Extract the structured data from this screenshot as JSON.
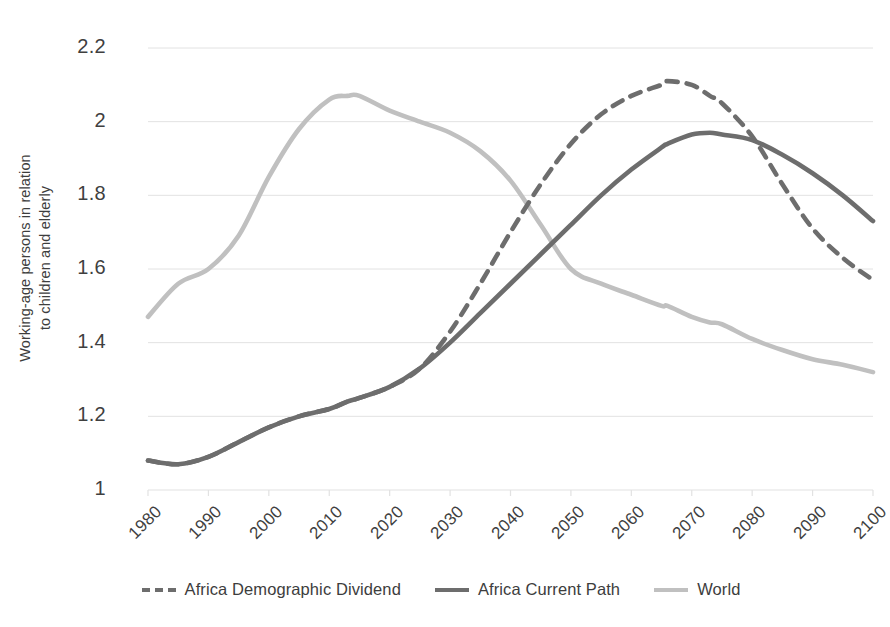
{
  "chart_data": {
    "type": "line",
    "title": "",
    "xlabel": "",
    "ylabel": "Working-age persons in relation to children and elderly",
    "ylabel_line1": "Working-age persons in relation",
    "ylabel_line2": "to children and elderly",
    "xlim": [
      1980,
      2100
    ],
    "ylim": [
      1,
      2.2
    ],
    "grid": true,
    "legend_position": "bottom",
    "yticks": [
      "1",
      "1.2",
      "1.4",
      "1.6",
      "1.8",
      "2",
      "2.2"
    ],
    "ytick_values": [
      1,
      1.2,
      1.4,
      1.6,
      1.8,
      2,
      2.2
    ],
    "xticks": [
      "1980",
      "1990",
      "2000",
      "2010",
      "2020",
      "2030",
      "2040",
      "2050",
      "2060",
      "2070",
      "2080",
      "2090",
      "2100"
    ],
    "xtick_values": [
      1980,
      1990,
      2000,
      2010,
      2020,
      2030,
      2040,
      2050,
      2060,
      2070,
      2080,
      2090,
      2100
    ],
    "x": [
      1980,
      1985,
      1990,
      1995,
      2000,
      2005,
      2010,
      2013,
      2015,
      2020,
      2025,
      2030,
      2035,
      2040,
      2045,
      2050,
      2055,
      2060,
      2065,
      2066,
      2070,
      2073,
      2075,
      2080,
      2085,
      2090,
      2095,
      2100
    ],
    "series": [
      {
        "name": "Africa Demographic Dividend",
        "style": "dashed",
        "color": "#6d6d6d",
        "values": [
          1.08,
          1.07,
          1.09,
          1.13,
          1.17,
          1.2,
          1.22,
          1.24,
          1.25,
          1.28,
          1.33,
          1.43,
          1.56,
          1.7,
          1.83,
          1.94,
          2.02,
          2.07,
          2.1,
          2.11,
          2.1,
          2.07,
          2.05,
          1.96,
          1.83,
          1.71,
          1.63,
          1.57
        ]
      },
      {
        "name": "Africa Current Path",
        "style": "solid",
        "color": "#6d6d6d",
        "values": [
          1.08,
          1.07,
          1.09,
          1.13,
          1.17,
          1.2,
          1.22,
          1.24,
          1.25,
          1.28,
          1.33,
          1.4,
          1.48,
          1.56,
          1.64,
          1.72,
          1.8,
          1.87,
          1.93,
          1.94,
          1.965,
          1.97,
          1.965,
          1.95,
          1.91,
          1.86,
          1.8,
          1.73
        ]
      },
      {
        "name": "World",
        "style": "solid",
        "color": "#c0c0c0",
        "values": [
          1.47,
          1.56,
          1.6,
          1.69,
          1.85,
          1.98,
          2.06,
          2.07,
          2.07,
          2.03,
          2.0,
          1.97,
          1.92,
          1.84,
          1.72,
          1.6,
          1.56,
          1.53,
          1.5,
          1.5,
          1.47,
          1.455,
          1.45,
          1.41,
          1.38,
          1.355,
          1.34,
          1.32
        ]
      }
    ]
  },
  "legend": {
    "items": [
      {
        "label": "Africa Demographic Dividend",
        "style": "dashed"
      },
      {
        "label": "Africa Current Path",
        "style": "solid"
      },
      {
        "label": "World",
        "style": "solid-light"
      }
    ]
  },
  "colors": {
    "dark_line": "#6d6d6d",
    "light_line": "#c0c0c0",
    "gridline": "#e2e2e2",
    "text": "#3f3f3f",
    "background": "#ffffff"
  }
}
